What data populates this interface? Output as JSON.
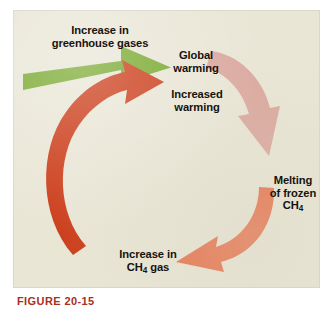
{
  "figure": {
    "caption": "FIGURE 20-15",
    "panel_background": "#e9e6d5",
    "page_background": "#ffffff",
    "text_color": "#17120e"
  },
  "diagram": {
    "type": "cyclical-feedback-loop",
    "direction": "clockwise",
    "nodes": [
      {
        "id": "greenhouse-gases",
        "label_line1": "Increase in",
        "label_line2": "greenhouse gases",
        "position": "top-left"
      },
      {
        "id": "global-warming",
        "label_line1": "Global",
        "label_line2": "warming",
        "position": "top-center"
      },
      {
        "id": "increased-warming",
        "label_line1": "Increased",
        "label_line2": "warming",
        "position": "center-top"
      },
      {
        "id": "melting-frozen-ch4",
        "label_line1": "Melting",
        "label_line2": "of frozen",
        "label_line3": "CH",
        "label_subscript": "4",
        "position": "right"
      },
      {
        "id": "increase-ch4-gas",
        "label_line1": "Increase in",
        "label_line2": "CH",
        "label_subscript": "4",
        "label_line2_tail": " gas",
        "position": "bottom-left"
      }
    ],
    "arrows": [
      {
        "id": "arrow-greenhouse-to-global",
        "name": "green-straight-arrow",
        "color": "#77a82e",
        "shape": "straight-horizontal",
        "from": "greenhouse-gases",
        "to": "global-warming",
        "points": "right"
      },
      {
        "id": "arrow-global-to-melting",
        "name": "pink-curved-arrow",
        "color": "#dba7a0",
        "shape": "curve-clockwise",
        "from": "global-warming",
        "to": "melting-frozen-ch4",
        "points": "down-left"
      },
      {
        "id": "arrow-melting-to-ch4gas",
        "name": "salmon-curved-arrow",
        "color": "#e8704a",
        "shape": "curve-clockwise",
        "from": "melting-frozen-ch4",
        "to": "increase-ch4-gas",
        "points": "left"
      },
      {
        "id": "arrow-ch4gas-to-increased-warming",
        "name": "red-curved-arrow",
        "color": "#cc3d1a",
        "shape": "curve-clockwise",
        "from": "increase-ch4-gas",
        "to": "increased-warming",
        "points": "up-right"
      }
    ]
  }
}
